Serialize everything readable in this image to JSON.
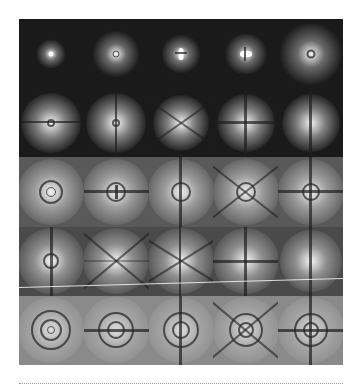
{
  "figure": {
    "type": "image-grid",
    "rows": 5,
    "cols": 5,
    "colors": {
      "background": "#1a1a1a",
      "page": "#ffffff",
      "rule": "#999999"
    },
    "cells": [
      [
        {
          "pattern": "small-spot"
        },
        {
          "pattern": "spot-with-tiny-ring"
        },
        {
          "pattern": "double-lobe-vertical"
        },
        {
          "pattern": "double-lobe-horizontal"
        },
        {
          "pattern": "large-spot-with-ring"
        }
      ],
      [
        {
          "pattern": "spot-horizontal-line"
        },
        {
          "pattern": "spot-vertical-line"
        },
        {
          "pattern": "x-cross"
        },
        {
          "pattern": "plus-cross"
        },
        {
          "pattern": "vertical-split-lobes"
        }
      ],
      [
        {
          "pattern": "concentric-rings"
        },
        {
          "pattern": "rings-horizontal-line"
        },
        {
          "pattern": "rings-vertical-line"
        },
        {
          "pattern": "rings-x-cross"
        },
        {
          "pattern": "rings-plus-cross"
        }
      ],
      [
        {
          "pattern": "ring-vertical-line"
        },
        {
          "pattern": "x-cross"
        },
        {
          "pattern": "x-cross"
        },
        {
          "pattern": "plus-cross"
        },
        {
          "pattern": "vertical-split-lobes"
        }
      ],
      [
        {
          "pattern": "concentric-rings"
        },
        {
          "pattern": "rings-horizontal-line"
        },
        {
          "pattern": "rings-vertical-line"
        },
        {
          "pattern": "rings-x-cross"
        },
        {
          "pattern": "rings-plus-cross"
        }
      ]
    ]
  }
}
